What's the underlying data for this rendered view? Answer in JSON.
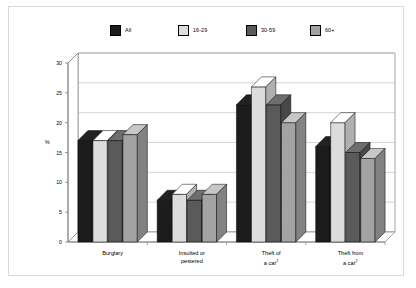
{
  "chart_data": {
    "type": "bar",
    "title": "",
    "subtitle": "",
    "xlabel": "",
    "ylabel": "%",
    "ylim": [
      0,
      30
    ],
    "yticks": [
      0,
      5,
      10,
      15,
      20,
      25,
      30
    ],
    "grid": true,
    "legend_position": "top",
    "style": "3d-grouped-column",
    "categories": [
      "Burglary",
      "Insulted or pestered",
      "Theft of a car2",
      "Theft from a car2"
    ],
    "category_lines": [
      [
        "Burglary"
      ],
      [
        "Insulted or",
        "pestered"
      ],
      [
        "Theft of",
        "a car2"
      ],
      [
        "Theft from",
        "a car2"
      ]
    ],
    "series": [
      {
        "name": "All",
        "color": "#1c1c1c",
        "values": [
          17,
          7,
          23,
          16
        ]
      },
      {
        "name": "16-29",
        "color": "#dcdcdc",
        "values": [
          17,
          8,
          26,
          20
        ]
      },
      {
        "name": "30-59",
        "color": "#5a5a5a",
        "values": [
          17,
          7,
          23,
          15
        ]
      },
      {
        "name": "60+",
        "color": "#a3a3a3",
        "values": [
          18,
          8,
          20,
          14
        ]
      }
    ]
  },
  "legend": {
    "items": [
      {
        "label": "All",
        "color": "#1c1c1c"
      },
      {
        "label": "16-29",
        "color": "#dcdcdc"
      },
      {
        "label": "30-59",
        "color": "#5a5a5a"
      },
      {
        "label": "60+",
        "color": "#a3a3a3"
      }
    ]
  },
  "axes": {
    "y_axis_title": "%",
    "y_tick_labels": [
      "0",
      "5",
      "10",
      "15",
      "20",
      "25",
      "30"
    ],
    "x_tick_labels": [
      "Burglary",
      "Insulted or|pestered",
      "Theft of|a car2",
      "Theft from|a car2"
    ]
  },
  "colors": {
    "frame_border": "#d9d9d9",
    "grid_line": "#b9b9b9",
    "axis_line": "#808080",
    "background": "#ffffff"
  }
}
